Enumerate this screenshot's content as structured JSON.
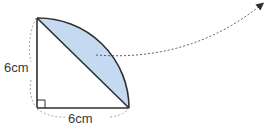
{
  "figure": {
    "shape": "quarter-circle",
    "right_angle_marker": true,
    "shaded_region": "circular-segment",
    "arrow": "dashed-arrow-pointing-up-right"
  },
  "labels": {
    "left_side": "6cm",
    "bottom_side": "6cm"
  },
  "colors": {
    "shade_fill": "#c5d9f1",
    "stroke": "#2f2f2f",
    "dashed": "#9a9a9a",
    "text": "#3a3a3a"
  }
}
